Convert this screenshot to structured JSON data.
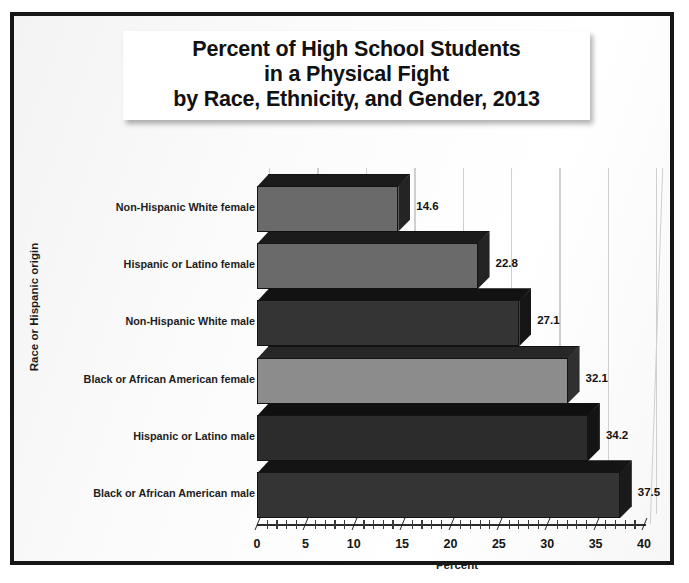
{
  "chart_data": {
    "type": "bar",
    "orientation": "horizontal",
    "title": "Percent of High School Students in a Physical Fight by Race, Ethnicity, and Gender, 2013",
    "title_lines": [
      "Percent of High School Students",
      "in a Physical Fight",
      "by Race, Ethnicity, and Gender, 2013"
    ],
    "xlabel": "Percent",
    "ylabel": "Race or Hispanic origin",
    "xlim": [
      0,
      40
    ],
    "xticks": [
      0,
      5,
      10,
      15,
      20,
      25,
      30,
      35,
      40
    ],
    "xtick_labels": [
      "0",
      "5",
      "10",
      "15",
      "20",
      "25",
      "30",
      "35",
      "40"
    ],
    "minor_tick_step": 1,
    "grid": "vertical",
    "legend": "none",
    "categories": [
      "Non-Hispanic White female",
      "Hispanic or Latino female",
      "Non-Hispanic White male",
      "Black or African American female",
      "Hispanic or Latino male",
      "Black or African American male"
    ],
    "values": [
      14.6,
      22.8,
      27.1,
      32.1,
      34.2,
      37.5
    ],
    "value_labels": [
      "14.6",
      "22.8",
      "27.1",
      "32.1",
      "34.2",
      "37.5"
    ],
    "bar_colors": [
      "#6a6a6a",
      "#6a6a6a",
      "#343434",
      "#8c8c8c",
      "#2c2c2c",
      "#343434"
    ],
    "bar_top_colors": [
      "#1b1b1b",
      "#1b1b1b",
      "#121212",
      "#272727",
      "#101010",
      "#141414"
    ],
    "bar_side_colors": [
      "#242424",
      "#242424",
      "#161616",
      "#303030",
      "#141414",
      "#1a1a1a"
    ]
  },
  "style": {
    "frame_border_color": "#161616",
    "gridline_color": "#cfcfcf",
    "axis_color": "#2a2a2a",
    "text_color": "#141414",
    "title_background": "#ffffff",
    "plot_background": "#fbfbfb"
  }
}
